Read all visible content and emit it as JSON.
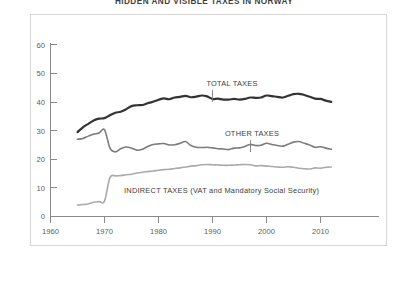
{
  "title": "HIDDEN AND VISIBLE TAXES IN NORWAY",
  "axes": {
    "y_ticks": [
      "0",
      "10",
      "20",
      "30",
      "40",
      "50",
      "60"
    ],
    "x_ticks": [
      "1960",
      "1970",
      "1980",
      "1990",
      "2000",
      "2010"
    ]
  },
  "labels": {
    "total": "TOTAL TAXES",
    "other": "OTHER TAXES",
    "indirect": "INDIRECT TAXES (VAT and Mandatory Social Security)"
  },
  "colors": {
    "total": "#333333",
    "other": "#7c7c7c",
    "indirect": "#aaaaaa",
    "axis": "#8a8a8a",
    "frame": "#d6d6d6",
    "text": "#3c3c3c",
    "background": "#ffffff"
  },
  "chart_data": {
    "type": "line",
    "title": "HIDDEN AND VISIBLE TAXES IN NORWAY",
    "xlabel": "",
    "ylabel": "",
    "xlim": [
      1960,
      2014
    ],
    "ylim": [
      0,
      60
    ],
    "grid": false,
    "legend": "inline-annotations",
    "x_tick_values": [
      1960,
      1970,
      1980,
      1990,
      2000,
      2010
    ],
    "y_tick_values": [
      0,
      10,
      20,
      30,
      40,
      50,
      60
    ],
    "units": "percent of GDP",
    "series": [
      {
        "name": "TOTAL TAXES",
        "color": "#333333",
        "linewidth": 2.2,
        "x": [
          1965,
          1966,
          1967,
          1968,
          1969,
          1970,
          1971,
          1972,
          1973,
          1974,
          1975,
          1976,
          1977,
          1978,
          1979,
          1980,
          1981,
          1982,
          1983,
          1984,
          1985,
          1986,
          1987,
          1988,
          1989,
          1990,
          1991,
          1992,
          1993,
          1994,
          1995,
          1996,
          1997,
          1998,
          1999,
          2000,
          2001,
          2002,
          2003,
          2004,
          2005,
          2006,
          2007,
          2008,
          2009,
          2010,
          2011,
          2012
        ],
        "values": [
          29.5,
          31.2,
          32.4,
          33.6,
          34.2,
          34.4,
          35.4,
          36.3,
          36.6,
          37.5,
          38.6,
          38.9,
          39.0,
          39.6,
          40.1,
          40.8,
          41.3,
          41.0,
          41.6,
          41.8,
          42.2,
          41.7,
          41.9,
          42.3,
          42.0,
          41.1,
          41.2,
          40.9,
          40.9,
          41.1,
          40.9,
          41.1,
          41.6,
          41.5,
          41.6,
          42.3,
          42.1,
          41.8,
          41.6,
          42.2,
          42.8,
          42.9,
          42.5,
          41.9,
          41.2,
          41.1,
          40.5,
          40.1
        ]
      },
      {
        "name": "OTHER TAXES",
        "color": "#7c7c7c",
        "linewidth": 1.6,
        "x": [
          1965,
          1966,
          1967,
          1968,
          1969,
          1970,
          1971,
          1972,
          1973,
          1974,
          1975,
          1976,
          1977,
          1978,
          1979,
          1980,
          1981,
          1982,
          1983,
          1984,
          1985,
          1986,
          1987,
          1988,
          1989,
          1990,
          1991,
          1992,
          1993,
          1994,
          1995,
          1996,
          1997,
          1998,
          1999,
          2000,
          2001,
          2002,
          2003,
          2004,
          2005,
          2006,
          2007,
          2008,
          2009,
          2010,
          2011,
          2012
        ],
        "values": [
          27.0,
          27.3,
          28.1,
          28.8,
          29.2,
          30.3,
          24.0,
          22.6,
          23.7,
          24.3,
          23.9,
          23.2,
          23.5,
          24.5,
          25.2,
          25.4,
          25.5,
          25.0,
          25.1,
          25.6,
          26.2,
          24.8,
          24.2,
          24.1,
          24.2,
          24.0,
          23.7,
          23.6,
          23.4,
          23.9,
          24.0,
          24.5,
          25.2,
          24.8,
          24.9,
          25.6,
          25.2,
          24.8,
          24.6,
          25.3,
          26.0,
          26.2,
          25.6,
          25.0,
          24.2,
          24.4,
          23.9,
          23.5
        ]
      },
      {
        "name": "INDIRECT TAXES (VAT and Mandatory Social Security)",
        "color": "#aaaaaa",
        "linewidth": 1.6,
        "x": [
          1965,
          1966,
          1967,
          1968,
          1969,
          1970,
          1971,
          1972,
          1973,
          1974,
          1975,
          1976,
          1977,
          1978,
          1979,
          1980,
          1981,
          1982,
          1983,
          1984,
          1985,
          1986,
          1987,
          1988,
          1989,
          1990,
          1991,
          1992,
          1993,
          1994,
          1995,
          1996,
          1997,
          1998,
          1999,
          2000,
          2001,
          2002,
          2003,
          2004,
          2005,
          2006,
          2007,
          2008,
          2009,
          2010,
          2011,
          2012
        ],
        "values": [
          4.0,
          4.2,
          4.4,
          5.0,
          5.2,
          5.4,
          13.6,
          14.2,
          14.3,
          14.6,
          14.8,
          15.2,
          15.5,
          15.7,
          15.9,
          16.2,
          16.4,
          16.5,
          16.8,
          17.0,
          17.3,
          17.6,
          17.8,
          18.1,
          18.2,
          18.1,
          18.0,
          17.9,
          17.9,
          18.0,
          18.1,
          18.2,
          18.1,
          17.7,
          17.8,
          17.6,
          17.5,
          17.3,
          17.2,
          17.4,
          17.2,
          16.9,
          16.7,
          16.6,
          17.0,
          16.9,
          17.2,
          17.3
        ]
      }
    ],
    "annotations": [
      {
        "text": "TOTAL TAXES",
        "x": 1990,
        "y": 50.5,
        "leader_to_y": 43.5
      },
      {
        "text": "OTHER TAXES",
        "x": 1993,
        "y": 33.5,
        "leader_to_y": 26.5
      },
      {
        "text": "INDIRECT TAXES (VAT and Mandatory Social Security)",
        "x": 1985,
        "y": 11.0,
        "leader_to_y": null
      }
    ]
  }
}
